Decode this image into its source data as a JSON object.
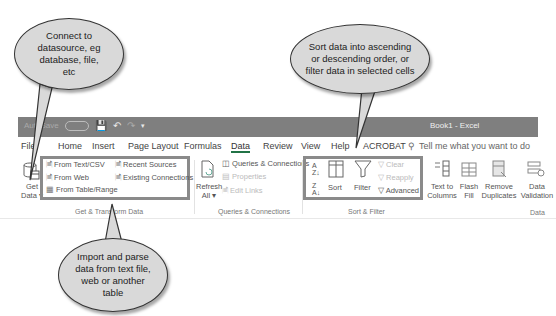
{
  "window": {
    "title": "Book1  -  Excel",
    "quick_access": [
      "AutoSave",
      "Off",
      "save-icon",
      "undo-icon",
      "redo-icon",
      "customize-icon"
    ]
  },
  "tabs": [
    {
      "label": "File"
    },
    {
      "label": "Home"
    },
    {
      "label": "Insert"
    },
    {
      "label": "Page Layout"
    },
    {
      "label": "Formulas"
    },
    {
      "label": "Data",
      "active": true
    },
    {
      "label": "Review"
    },
    {
      "label": "View"
    },
    {
      "label": "Help"
    },
    {
      "label": "ACROBAT"
    }
  ],
  "tell_me": "Tell me what you want to do",
  "groups": {
    "get_transform": {
      "label": "Get & Transform Data",
      "get_data": [
        "Get",
        "Data"
      ],
      "items": [
        "From Text/CSV",
        "From Web",
        "From Table/Range",
        "Recent Sources",
        "Existing Connections"
      ]
    },
    "queries": {
      "label": "Queries & Connections",
      "refresh": [
        "Refresh",
        "All"
      ],
      "items": [
        "Queries & Connections",
        "Properties",
        "Edit Links"
      ]
    },
    "sort_filter": {
      "label": "Sort & Filter",
      "sort": "Sort",
      "filter": "Filter",
      "items": [
        "Clear",
        "Reapply",
        "Advanced"
      ]
    },
    "data_tools": {
      "label": "Data",
      "buttons": [
        [
          "Text to",
          "Columns"
        ],
        [
          "Flash",
          "Fill"
        ],
        [
          "Remove",
          "Duplicates"
        ],
        [
          "Data",
          "Validation"
        ]
      ]
    }
  },
  "callouts": [
    {
      "text": "Connect to datasource, eg database, file, etc"
    },
    {
      "text": "Sort data into ascending or descending order, or filter data in selected cells"
    },
    {
      "text": "Import and parse data from text file, web or another table"
    }
  ],
  "colors": {
    "accent": "#217346",
    "highlight": "#8a8a8a",
    "titlebar": "#7f7f7f",
    "bubble": "#d9d9d9"
  }
}
